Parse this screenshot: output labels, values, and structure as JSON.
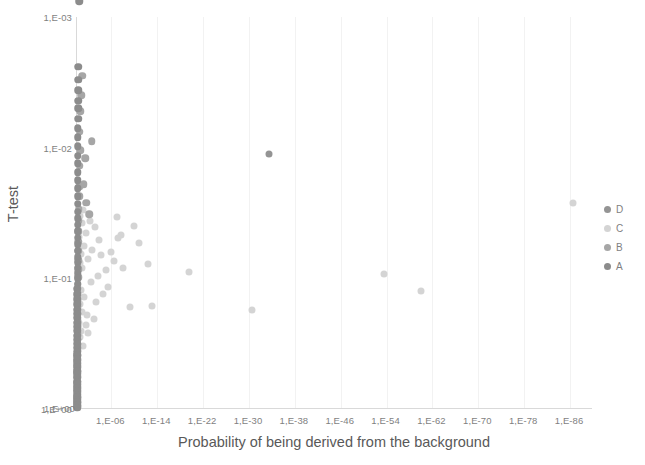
{
  "chart_data": {
    "type": "scatter",
    "title": "",
    "xlabel": "Probability of being derived from the background",
    "ylabel": "T-test",
    "x_scale": "log",
    "y_scale": "log-reversed",
    "xlim": [
      1,
      1e-90
    ],
    "ylim": [
      0.001,
      1
    ],
    "grid": "vertical-only",
    "legend_position": "right",
    "xticks": [
      "1,E+00",
      "1,E-06",
      "1,E-14",
      "1,E-22",
      "1,E-30",
      "1,E-38",
      "1,E-46",
      "1,E-54",
      "1,E-62",
      "1,E-70",
      "1,E-78",
      "1,E-86"
    ],
    "yticks": [
      "1,E-03",
      "1,E-02",
      "1,E-01",
      "1,E+00"
    ],
    "series": [
      {
        "name": "D",
        "color": "#949494",
        "points": [
          [
            -33.5,
            -1.95
          ]
        ]
      },
      {
        "name": "C",
        "color": "#d4d4d4",
        "points": [
          [
            -86.5,
            -1.58
          ],
          [
            -60.0,
            -0.9
          ],
          [
            -53.5,
            -1.03
          ],
          [
            -30.5,
            -0.76
          ],
          [
            -19.5,
            -1.05
          ],
          [
            -13.0,
            -0.79
          ],
          [
            -12.3,
            -1.11
          ],
          [
            -10.8,
            -1.27
          ],
          [
            -9.9,
            -1.4
          ],
          [
            -9.2,
            -0.78
          ],
          [
            -8.1,
            -1.08
          ],
          [
            -7.6,
            -1.33
          ],
          [
            -7.1,
            -1.31
          ],
          [
            -6.9,
            -1.47
          ],
          [
            -6.4,
            -1.13
          ],
          [
            -5.9,
            -1.2
          ],
          [
            -5.4,
            -0.93
          ],
          [
            -5.0,
            -1.06
          ],
          [
            -4.6,
            -0.88
          ],
          [
            -4.2,
            -1.18
          ],
          [
            -3.9,
            -1.29
          ],
          [
            -3.6,
            -1.02
          ],
          [
            -3.3,
            -0.82
          ],
          [
            -3.1,
            -1.39
          ],
          [
            -2.9,
            -0.69
          ],
          [
            -2.6,
            -1.22
          ],
          [
            -2.4,
            -0.97
          ],
          [
            -2.2,
            -1.44
          ],
          [
            -2.0,
            -0.58
          ],
          [
            -1.9,
            -1.15
          ],
          [
            -1.7,
            -0.72
          ],
          [
            -1.6,
            -1.35
          ],
          [
            -1.5,
            -0.64
          ],
          [
            -1.3,
            -1.25
          ],
          [
            -1.2,
            -0.86
          ],
          [
            -1.1,
            -1.52
          ],
          [
            -1.0,
            -0.48
          ],
          [
            -0.9,
            -1.08
          ],
          [
            -0.85,
            -0.74
          ],
          [
            -0.8,
            -1.42
          ],
          [
            -0.75,
            -0.6
          ],
          [
            -0.7,
            -1.19
          ],
          [
            -0.65,
            -0.91
          ],
          [
            -0.6,
            -1.48
          ],
          [
            -0.55,
            -0.55
          ],
          [
            -0.5,
            -1.12
          ],
          [
            -0.45,
            -0.8
          ],
          [
            -0.4,
            -1.32
          ],
          [
            -0.35,
            -0.66
          ],
          [
            -0.3,
            -1.23
          ]
        ]
      },
      {
        "name": "B",
        "color": "#a6a6a6",
        "points": [
          [
            -0.9,
            -2.55
          ],
          [
            -0.7,
            -2.4
          ],
          [
            -0.55,
            -2.28
          ],
          [
            -0.45,
            -1.86
          ],
          [
            -0.4,
            -1.7
          ],
          [
            -0.35,
            -1.63
          ],
          [
            -0.3,
            -1.53
          ],
          [
            -0.28,
            -1.44
          ],
          [
            -0.26,
            -1.36
          ],
          [
            -0.24,
            -1.28
          ],
          [
            -0.22,
            -1.21
          ],
          [
            -0.2,
            -1.14
          ],
          [
            -0.19,
            -1.07
          ],
          [
            -0.18,
            -1.01
          ],
          [
            -0.17,
            -0.95
          ],
          [
            -0.16,
            -0.89
          ],
          [
            -0.15,
            -0.83
          ],
          [
            -0.14,
            -0.78
          ],
          [
            -0.13,
            -0.73
          ],
          [
            -0.12,
            -0.68
          ],
          [
            -0.11,
            -0.63
          ],
          [
            -0.105,
            -0.58
          ],
          [
            -0.1,
            -0.53
          ],
          [
            -0.095,
            -0.49
          ],
          [
            -0.09,
            -0.45
          ],
          [
            -0.085,
            -0.41
          ],
          [
            -0.08,
            -0.37
          ],
          [
            -0.075,
            -0.33
          ],
          [
            -0.07,
            -0.29
          ],
          [
            -0.065,
            -0.25
          ],
          [
            -0.06,
            -0.21
          ],
          [
            -0.055,
            -0.17
          ],
          [
            -0.05,
            -0.13
          ],
          [
            -0.045,
            -0.09
          ],
          [
            -0.04,
            -0.05
          ],
          [
            -0.035,
            -0.02
          ],
          [
            -1.6,
            -1.58
          ],
          [
            -1.2,
            -1.72
          ],
          [
            -2.1,
            -1.49
          ],
          [
            -1.45,
            -1.92
          ],
          [
            -2.6,
            -2.05
          ],
          [
            -0.5,
            -2.12
          ],
          [
            -0.6,
            -1.98
          ]
        ]
      },
      {
        "name": "A",
        "color": "#8c8c8c",
        "points": [
          [
            -0.35,
            -3.12
          ],
          [
            -0.32,
            -3.22
          ],
          [
            -0.3,
            -3.38
          ],
          [
            -0.28,
            -3.52
          ],
          [
            -0.25,
            -2.62
          ],
          [
            -0.23,
            -2.52
          ],
          [
            -0.22,
            -2.44
          ],
          [
            -0.2,
            -2.36
          ],
          [
            -0.19,
            -2.3
          ],
          [
            -0.18,
            -2.22
          ],
          [
            -0.17,
            -2.15
          ],
          [
            -0.16,
            -2.08
          ],
          [
            -0.155,
            -2.01
          ],
          [
            -0.15,
            -1.94
          ],
          [
            -0.145,
            -1.88
          ],
          [
            -0.14,
            -1.81
          ],
          [
            -0.135,
            -1.75
          ],
          [
            -0.13,
            -1.69
          ],
          [
            -0.125,
            -1.63
          ],
          [
            -0.12,
            -1.57
          ],
          [
            -0.118,
            -1.51
          ],
          [
            -0.115,
            -1.46
          ],
          [
            -0.112,
            -1.41
          ],
          [
            -0.11,
            -1.36
          ],
          [
            -0.108,
            -1.31
          ],
          [
            -0.105,
            -1.26
          ],
          [
            -0.102,
            -1.21
          ],
          [
            -0.1,
            -1.16
          ],
          [
            -0.098,
            -1.12
          ],
          [
            -0.095,
            -1.08
          ],
          [
            -0.093,
            -1.04
          ],
          [
            -0.09,
            -1.0
          ],
          [
            -0.088,
            -0.96
          ],
          [
            -0.085,
            -0.92
          ],
          [
            -0.083,
            -0.88
          ],
          [
            -0.08,
            -0.84
          ],
          [
            -0.078,
            -0.8
          ],
          [
            -0.075,
            -0.76
          ],
          [
            -0.073,
            -0.73
          ],
          [
            -0.07,
            -0.7
          ],
          [
            -0.068,
            -0.66
          ],
          [
            -0.065,
            -0.63
          ],
          [
            -0.063,
            -0.6
          ],
          [
            -0.06,
            -0.56
          ],
          [
            -0.058,
            -0.53
          ],
          [
            -0.055,
            -0.5
          ],
          [
            -0.053,
            -0.47
          ],
          [
            -0.05,
            -0.44
          ],
          [
            -0.048,
            -0.41
          ],
          [
            -0.046,
            -0.38
          ],
          [
            -0.044,
            -0.35
          ],
          [
            -0.042,
            -0.32
          ],
          [
            -0.04,
            -0.29
          ],
          [
            -0.038,
            -0.27
          ],
          [
            -0.036,
            -0.24
          ],
          [
            -0.034,
            -0.21
          ],
          [
            -0.032,
            -0.19
          ],
          [
            -0.03,
            -0.16
          ],
          [
            -0.028,
            -0.14
          ],
          [
            -0.026,
            -0.11
          ],
          [
            -0.024,
            -0.09
          ],
          [
            -0.022,
            -0.07
          ],
          [
            -0.02,
            -0.05
          ],
          [
            -0.018,
            -0.03
          ],
          [
            -0.016,
            -0.01
          ]
        ]
      }
    ]
  },
  "legend": {
    "items": [
      {
        "label": "D",
        "color": "#949494"
      },
      {
        "label": "C",
        "color": "#d4d4d4"
      },
      {
        "label": "B",
        "color": "#a6a6a6"
      },
      {
        "label": "A",
        "color": "#8c8c8c"
      }
    ]
  }
}
